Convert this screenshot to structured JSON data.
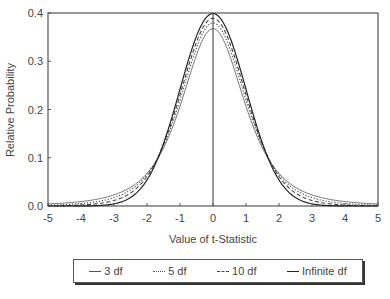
{
  "chart_data": {
    "type": "line",
    "title": "",
    "xlabel": "Value of t-Statistic",
    "ylabel": "Relative Probability",
    "xlim": [
      -5,
      5
    ],
    "ylim": [
      0.0,
      0.4
    ],
    "x_ticks": [
      "-5",
      "-4",
      "-3",
      "-2",
      "-1",
      "0",
      "1",
      "2",
      "3",
      "4",
      "5"
    ],
    "y_ticks": [
      "0.0",
      "0.1",
      "0.2",
      "0.3",
      "0.4"
    ],
    "grid": false,
    "legend_position": "bottom",
    "x": [
      -5,
      -4,
      -3,
      -2,
      -1,
      0,
      1,
      2,
      3,
      4,
      5
    ],
    "series": [
      {
        "name": "3 df",
        "df": 3,
        "style": "solid-thin",
        "values": [
          0.004,
          0.009,
          0.023,
          0.068,
          0.207,
          0.368,
          0.207,
          0.068,
          0.023,
          0.009,
          0.004
        ]
      },
      {
        "name": "5 df",
        "df": 5,
        "style": "dotted",
        "values": [
          0.002,
          0.005,
          0.017,
          0.065,
          0.22,
          0.38,
          0.22,
          0.065,
          0.017,
          0.005,
          0.002
        ]
      },
      {
        "name": "10 df",
        "df": 10,
        "style": "dashed",
        "values": [
          0.0,
          0.002,
          0.011,
          0.061,
          0.23,
          0.389,
          0.23,
          0.061,
          0.011,
          0.002,
          0.0
        ]
      },
      {
        "name": "Infinite df",
        "df": "inf",
        "style": "solid",
        "values": [
          0.0,
          0.0,
          0.004,
          0.054,
          0.242,
          0.399,
          0.242,
          0.054,
          0.004,
          0.0,
          0.0
        ]
      }
    ]
  },
  "legend": {
    "items": [
      {
        "label": "3 df",
        "glyph": "—"
      },
      {
        "label": "5 df",
        "glyph": "·····"
      },
      {
        "label": "10 df",
        "glyph": "- -"
      },
      {
        "label": "Infinite df",
        "glyph": "—"
      }
    ]
  }
}
